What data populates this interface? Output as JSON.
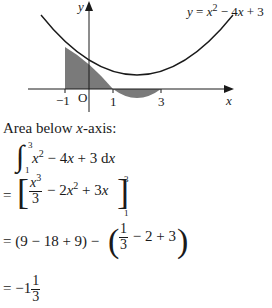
{
  "graph": {
    "equation_label": "y = x² − 4x + 3",
    "y_axis_label": "y",
    "x_axis_label": "x",
    "origin_label": "O",
    "tick_labels": [
      "−1",
      "1",
      "3"
    ],
    "function": "x^2 - 4x + 3",
    "shaded_regions": [
      {
        "from": -1,
        "to": 1,
        "side": "above x-axis"
      },
      {
        "from": 1,
        "to": 3,
        "side": "below x-axis"
      }
    ],
    "roots": [
      1,
      3
    ],
    "shade_color": "#7a7a7a"
  },
  "solution": {
    "heading": "Area below x-axis:",
    "heading_pre": "Area below ",
    "heading_var": "x",
    "heading_post": "-axis:",
    "integral": {
      "lower": "1",
      "upper": "3",
      "integrand": "x² − 4x + 3 dx"
    },
    "step1": {
      "prefix": "=",
      "frac_num": "x³",
      "frac_den": "3",
      "rest": "− 2x² + 3x",
      "upper": "3",
      "lower": "1"
    },
    "step2": {
      "prefix": "= (9 − 18 + 9) −",
      "frac_num": "1",
      "frac_den": "3",
      "rest": "− 2 + 3"
    },
    "step3": {
      "prefix": "= −1",
      "frac_num": "1",
      "frac_den": "3"
    }
  }
}
